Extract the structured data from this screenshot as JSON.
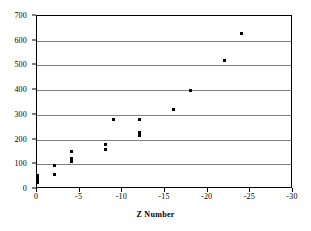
{
  "chart_data": {
    "type": "scatter",
    "title": "",
    "xlabel": "Z Number",
    "ylabel": "",
    "xlim": [
      0,
      -30
    ],
    "ylim": [
      0,
      700
    ],
    "xticks": [
      0,
      -5,
      -10,
      -15,
      -20,
      -25,
      -30
    ],
    "xtick_labels": [
      "0",
      "-5",
      "-10",
      "-15",
      "-20",
      "-25",
      "-30"
    ],
    "yticks": [
      0,
      100,
      200,
      300,
      400,
      500,
      600,
      700
    ],
    "ytick_labels": [
      "0",
      "100",
      "200",
      "300",
      "400",
      "500",
      "600",
      "700"
    ],
    "grid": "horizontal",
    "gridlines_at": [
      100,
      200,
      300,
      400,
      500,
      600
    ],
    "legend": "none",
    "marker": "square",
    "marker_color": "#000000",
    "points": [
      {
        "x": 0,
        "y": 25
      },
      {
        "x": 0,
        "y": 30
      },
      {
        "x": 0,
        "y": 35
      },
      {
        "x": 0,
        "y": 40
      },
      {
        "x": 0,
        "y": 45
      },
      {
        "x": 0,
        "y": 55
      },
      {
        "x": -2,
        "y": 60
      },
      {
        "x": -2,
        "y": 97
      },
      {
        "x": -4,
        "y": 112
      },
      {
        "x": -4,
        "y": 118
      },
      {
        "x": -4,
        "y": 125
      },
      {
        "x": -4,
        "y": 150
      },
      {
        "x": -8,
        "y": 160
      },
      {
        "x": -8,
        "y": 180
      },
      {
        "x": -9,
        "y": 280
      },
      {
        "x": -12,
        "y": 218
      },
      {
        "x": -12,
        "y": 230
      },
      {
        "x": -12,
        "y": 280
      },
      {
        "x": -16,
        "y": 320
      },
      {
        "x": -18,
        "y": 400
      },
      {
        "x": -22,
        "y": 520
      },
      {
        "x": -24,
        "y": 630
      }
    ]
  },
  "colors": {
    "axis": "#000000",
    "grid": "#808080",
    "marker": "#000000",
    "background": "#ffffff"
  }
}
